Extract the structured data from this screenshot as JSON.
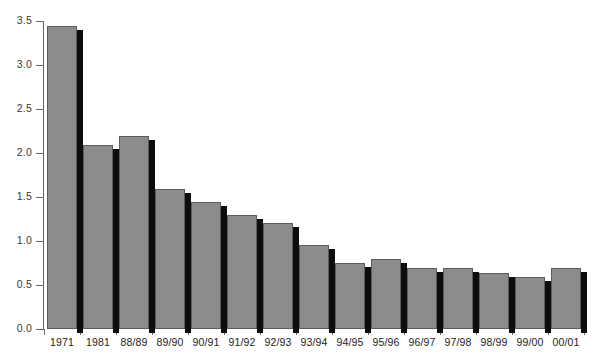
{
  "chart_data": {
    "type": "bar",
    "title": "",
    "subtitle": "",
    "xlabel": "",
    "ylabel": "",
    "categories": [
      "1971",
      "1981",
      "88/89",
      "89/90",
      "90/91",
      "91/92",
      "92/93",
      "93/94",
      "94/95",
      "95/96",
      "96/97",
      "97/98",
      "98/99",
      "99/00",
      "00/01"
    ],
    "values": [
      3.44,
      2.09,
      2.19,
      1.59,
      1.44,
      1.3,
      1.2,
      0.95,
      0.75,
      0.79,
      0.69,
      0.69,
      0.64,
      0.59,
      0.69
    ],
    "ylim": [
      0.0,
      3.5
    ],
    "ytick_values": [
      0.0,
      0.5,
      1.0,
      1.5,
      2.0,
      2.5,
      3.0,
      3.5
    ],
    "ytick_labels": [
      "0.0",
      "0.5",
      "1.0",
      "1.5",
      "2.0",
      "2.5",
      "3.0",
      "3.5"
    ],
    "grid": false,
    "legend": null,
    "legend_position": "none",
    "annotations": [],
    "bar_style": "3d-shadow",
    "colors": {
      "bar_fill": "#8c8c8c",
      "bar_edge": "#5c5c5c",
      "bar_shadow": "#0d0d0d",
      "axis": "#636363",
      "tick_label": "#1c1c1c",
      "y_tick_label": "#3a3a3a",
      "background": "#ffffff"
    }
  }
}
